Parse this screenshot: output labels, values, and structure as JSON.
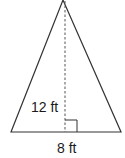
{
  "figure": {
    "shape": "isosceles triangle",
    "height_label": "12 ft",
    "base_label": "8 ft",
    "colors": {
      "stroke": "#333333",
      "altitude": "#555555",
      "text": "#1a1a1a",
      "background": "#ffffff"
    }
  }
}
